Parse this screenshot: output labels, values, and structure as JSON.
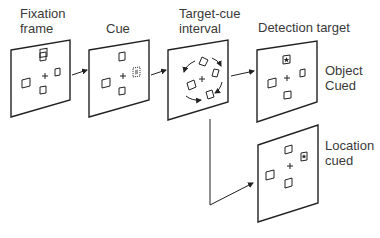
{
  "labels": {
    "fixation": "Fixation\nframe",
    "cue": "Cue",
    "interval": "Target-cue\ninterval",
    "detection": "Detection target",
    "object_cued": "Object\nCued",
    "location_cued": "Location\ncued"
  },
  "stages": [
    {
      "name": "Fixation frame",
      "cue": "none"
    },
    {
      "name": "Cue",
      "cue": "right square highlighted"
    },
    {
      "name": "Target-cue interval",
      "cue": "frame rotates (circular arrows)"
    },
    {
      "name": "Detection target - Object cued",
      "target": "top square"
    },
    {
      "name": "Detection target - Location cued",
      "target": "right square"
    }
  ],
  "colors": {
    "stroke": "#222222",
    "cue_fill": "#9a9a9a",
    "text": "#3a3a3a"
  }
}
